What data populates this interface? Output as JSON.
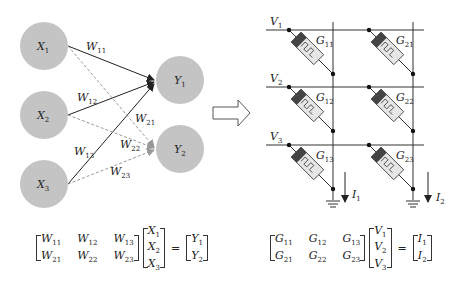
{
  "left_network": {
    "inputs": [
      {
        "name": "X",
        "sub": "1"
      },
      {
        "name": "X",
        "sub": "2"
      },
      {
        "name": "X",
        "sub": "3"
      }
    ],
    "outputs": [
      {
        "name": "Y",
        "sub": "1"
      },
      {
        "name": "Y",
        "sub": "2"
      }
    ],
    "weights": [
      {
        "name": "W",
        "sub": "11",
        "style": "solid"
      },
      {
        "name": "W",
        "sub": "12",
        "style": "solid"
      },
      {
        "name": "W",
        "sub": "13",
        "style": "solid"
      },
      {
        "name": "W",
        "sub": "21",
        "style": "dashed"
      },
      {
        "name": "W",
        "sub": "22",
        "style": "dashed"
      },
      {
        "name": "W",
        "sub": "23",
        "style": "dashed"
      }
    ],
    "node_color": "#c4c4c4"
  },
  "arrow": {
    "direction": "right"
  },
  "crossbar": {
    "rows": [
      {
        "name": "V",
        "sub": "1"
      },
      {
        "name": "V",
        "sub": "2"
      },
      {
        "name": "V",
        "sub": "3"
      }
    ],
    "cells": [
      {
        "name": "G",
        "sub": "11"
      },
      {
        "name": "G",
        "sub": "21"
      },
      {
        "name": "G",
        "sub": "12"
      },
      {
        "name": "G",
        "sub": "22"
      },
      {
        "name": "G",
        "sub": "13"
      },
      {
        "name": "G",
        "sub": "23"
      }
    ],
    "currents": [
      {
        "name": "I",
        "sub": "1"
      },
      {
        "name": "I",
        "sub": "2"
      }
    ]
  },
  "equation_left": {
    "matrix": [
      [
        "W",
        "11"
      ],
      [
        "W",
        "12"
      ],
      [
        "W",
        "13"
      ],
      [
        "W",
        "21"
      ],
      [
        "W",
        "22"
      ],
      [
        "W",
        "23"
      ]
    ],
    "vector": [
      [
        "X",
        "1"
      ],
      [
        "X",
        "2"
      ],
      [
        "X",
        "3"
      ]
    ],
    "equals": "=",
    "result": [
      [
        "Y",
        "1"
      ],
      [
        "Y",
        "2"
      ]
    ]
  },
  "equation_right": {
    "matrix": [
      [
        "G",
        "11"
      ],
      [
        "G",
        "12"
      ],
      [
        "G",
        "13"
      ],
      [
        "G",
        "21"
      ],
      [
        "G",
        "22"
      ],
      [
        "G",
        "23"
      ]
    ],
    "vector": [
      [
        "V",
        "1"
      ],
      [
        "V",
        "2"
      ],
      [
        "V",
        "3"
      ]
    ],
    "equals": "=",
    "result": [
      [
        "I",
        "1"
      ],
      [
        "I",
        "2"
      ]
    ]
  }
}
